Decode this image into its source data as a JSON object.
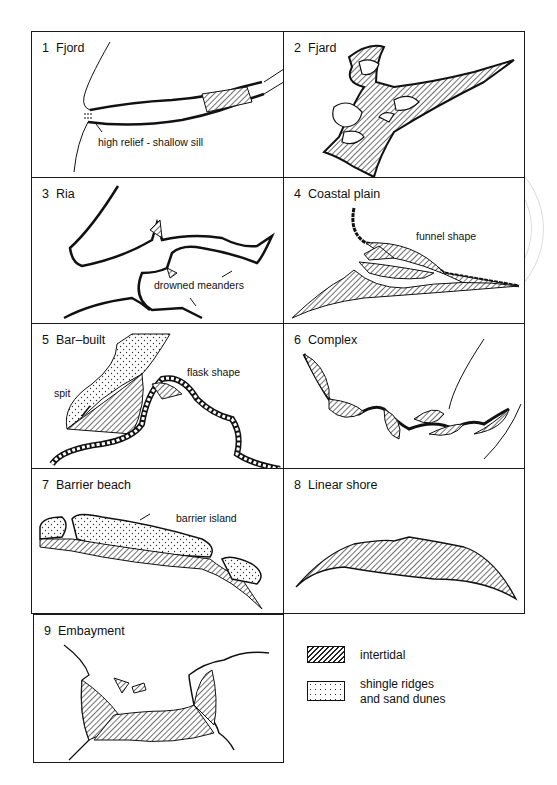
{
  "figure": {
    "panels": [
      {
        "number": "1",
        "name": "Fjord",
        "annotations": [
          "high relief - shallow sill"
        ]
      },
      {
        "number": "2",
        "name": "Fjard",
        "annotations": []
      },
      {
        "number": "3",
        "name": "Ria",
        "annotations": [
          "drowned meanders"
        ]
      },
      {
        "number": "4",
        "name": "Coastal plain",
        "annotations": [
          "funnel shape"
        ]
      },
      {
        "number": "5",
        "name": "Bar–built",
        "annotations": [
          "flask shape",
          "spit"
        ]
      },
      {
        "number": "6",
        "name": "Complex",
        "annotations": []
      },
      {
        "number": "7",
        "name": "Barrier beach",
        "annotations": [
          "barrier island"
        ]
      },
      {
        "number": "8",
        "name": "Linear shore",
        "annotations": []
      },
      {
        "number": "9",
        "name": "Embayment",
        "annotations": []
      }
    ],
    "legend": [
      {
        "pattern": "hatched",
        "label": "intertidal"
      },
      {
        "pattern": "dotted",
        "label_line1": "shingle ridges",
        "label_line2": "and sand dunes"
      }
    ]
  }
}
